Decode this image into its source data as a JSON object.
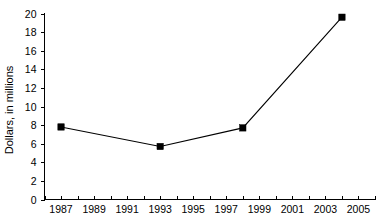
{
  "chart_data": {
    "type": "line",
    "title": "",
    "xlabel": "",
    "ylabel": "Dollars, in millions",
    "xlim": [
      1986,
      2006
    ],
    "ylim": [
      0,
      20
    ],
    "grid": false,
    "legend": null,
    "x": [
      1987,
      1993,
      1998,
      2004
    ],
    "values": [
      7.8,
      5.7,
      7.7,
      19.6
    ],
    "series": [
      {
        "name": "Dollars, in millions",
        "x": [
          1987,
          1993,
          1998,
          2004
        ],
        "values": [
          7.8,
          5.7,
          7.7,
          19.6
        ],
        "marker": "square",
        "color": "#000000"
      }
    ],
    "y_ticks": [
      0,
      2,
      4,
      6,
      8,
      10,
      12,
      14,
      16,
      18,
      20
    ],
    "y_tick_labels": [
      "0",
      "2",
      "4",
      "6",
      "8",
      "10",
      "12",
      "14",
      "16",
      "18",
      "20"
    ],
    "x_ticks": [
      1986,
      1987,
      1988,
      1989,
      1990,
      1991,
      1992,
      1993,
      1994,
      1995,
      1996,
      1997,
      1998,
      1999,
      2000,
      2001,
      2002,
      2003,
      2004,
      2005,
      2006
    ],
    "x_tick_labels": [
      "1987",
      "1989",
      "1991",
      "1993",
      "1995",
      "1997",
      "1999",
      "2001",
      "2003",
      "2005"
    ],
    "x_labeled_ticks": [
      1987,
      1989,
      1991,
      1993,
      1995,
      1997,
      1999,
      2001,
      2003,
      2005
    ]
  },
  "axes": {
    "y_axis_title": "Dollars, in millions",
    "line_color": "#000000",
    "marker_color": "#000000",
    "background": "#ffffff"
  }
}
